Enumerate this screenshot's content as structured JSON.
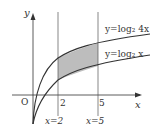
{
  "diagram": {
    "axes": {
      "x_label": "x",
      "y_label": "y",
      "origin_label": "O"
    },
    "tick_labels": {
      "x2": "2",
      "x5": "5"
    },
    "vertical_lines": [
      {
        "label": "x=2",
        "x": 2
      },
      {
        "label": "x=5",
        "x": 5
      }
    ],
    "curves": [
      {
        "label": "y=log₂ 4x",
        "expr": "log2(4x)"
      },
      {
        "label": "y=log₂ x",
        "expr": "log2(x)"
      }
    ],
    "shaded_region": {
      "from_x": 2,
      "to_x": 5,
      "between": [
        "log2(x)",
        "log2(4x)"
      ],
      "color": "#bdbdbd"
    },
    "colors": {
      "line": "#333333",
      "fill": "#bdbdbd"
    }
  }
}
